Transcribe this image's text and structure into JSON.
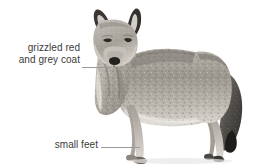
{
  "figure": {
    "background_color": "#ffffff",
    "subject_description": "greyscale photograph cut-out of a coyote standing in profile facing the viewer's left, full body visible with bushy dark-tipped tail hanging down",
    "width_px": 255,
    "height_px": 167
  },
  "annotations": [
    {
      "id": "coat",
      "line1": "grizzled red",
      "line2": "and grey coat",
      "text": "grizzled red and grey coat",
      "points_to": "shoulder and chest fur",
      "leader_line_color": "#9a9a9a"
    },
    {
      "id": "feet",
      "line1": "small feet",
      "line2": "",
      "text": "small feet",
      "points_to": "front paw",
      "leader_line_color": "#9a9a9a"
    }
  ],
  "style": {
    "text_color": "#3b3b3b",
    "leader_color": "#9a9a9a",
    "fur_light": "#d8d4cd",
    "fur_mid": "#a8a49d",
    "fur_dark": "#6e6a64",
    "fur_darkest": "#2e2c2a"
  }
}
